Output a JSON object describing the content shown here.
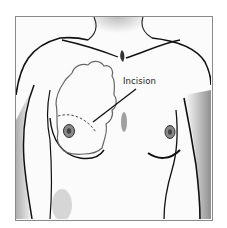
{
  "illustration": {
    "subject": "female-chest-anterior-view",
    "annotation": {
      "label": "Incision"
    },
    "colors": {
      "frame_border": "#8a8a8a",
      "outline": "#1a1a1a",
      "shading": "#555555",
      "tumor_outline": "#666666",
      "background": "#ffffff"
    }
  }
}
